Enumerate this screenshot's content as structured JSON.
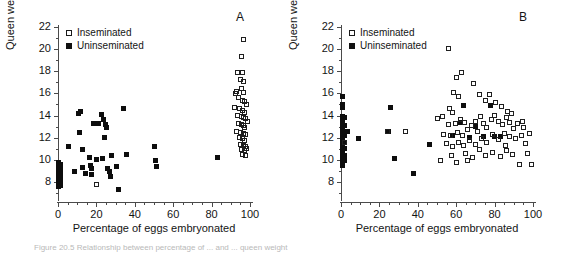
{
  "figure": {
    "caption_partial": "Figure 20.5  Relationship between percentage of ... and ... queen weight"
  },
  "chart_data": [
    {
      "type": "scatter",
      "panel_label": "A",
      "title": "",
      "xlabel": "Percentage of eggs embryonated",
      "ylabel": "Queen weight (mg)",
      "xlim": [
        0,
        100
      ],
      "ylim": [
        7,
        22
      ],
      "xticks": [
        0,
        20,
        40,
        60,
        80,
        100
      ],
      "yticks": [
        8,
        10,
        12,
        14,
        16,
        18,
        20,
        22
      ],
      "xtick_minor_step": 5,
      "ytick_minor_step": 1,
      "grid": false,
      "legend_position": "top-left",
      "legend": [
        "Inseminated",
        "Uninseminated"
      ],
      "series": [
        {
          "name": "Uninseminated",
          "marker": "filled-square",
          "points": [
            [
              0.4,
              9.8
            ],
            [
              0.4,
              9.4
            ],
            [
              0.4,
              9.1
            ],
            [
              0.4,
              8.8
            ],
            [
              0.4,
              8.5
            ],
            [
              0.4,
              8.2
            ],
            [
              0.4,
              7.9
            ],
            [
              0.4,
              7.6
            ],
            [
              1.2,
              9.6
            ],
            [
              1.2,
              9.2
            ],
            [
              1.2,
              8.9
            ],
            [
              1.2,
              8.6
            ],
            [
              1.2,
              8.3
            ],
            [
              1.2,
              8.0
            ],
            [
              1.2,
              7.7
            ],
            [
              5.5,
              11.2
            ],
            [
              8.5,
              8.9
            ],
            [
              10.5,
              14.2
            ],
            [
              11.5,
              14.4
            ],
            [
              11.0,
              12.5
            ],
            [
              12.5,
              10.9
            ],
            [
              13.0,
              9.3
            ],
            [
              14.5,
              8.8
            ],
            [
              16.5,
              10.2
            ],
            [
              17.0,
              9.5
            ],
            [
              17.5,
              9.2
            ],
            [
              17.5,
              8.7
            ],
            [
              18.5,
              13.3
            ],
            [
              19.5,
              13.3
            ],
            [
              21.0,
              13.3
            ],
            [
              20.0,
              10.0
            ],
            [
              22.5,
              14.1
            ],
            [
              23.5,
              13.6
            ],
            [
              24.5,
              13.2
            ],
            [
              25.5,
              12.9
            ],
            [
              24.0,
              12.0
            ],
            [
              23.0,
              10.1
            ],
            [
              26.0,
              9.2
            ],
            [
              27.0,
              8.9
            ],
            [
              27.5,
              8.5
            ],
            [
              28.0,
              10.4
            ],
            [
              30.5,
              9.4
            ],
            [
              31.5,
              7.3
            ],
            [
              34.0,
              14.6
            ],
            [
              35.5,
              10.5
            ],
            [
              50.0,
              11.2
            ],
            [
              51.0,
              9.9
            ],
            [
              51.5,
              9.4
            ],
            [
              83.0,
              10.2
            ]
          ]
        },
        {
          "name": "Inseminated",
          "marker": "open-square",
          "points": [
            [
              20.0,
              7.8
            ],
            [
              96.5,
              20.9
            ],
            [
              95.5,
              19.3
            ],
            [
              93.5,
              17.9
            ],
            [
              96.0,
              17.9
            ],
            [
              95.0,
              17.3
            ],
            [
              96.5,
              17.1
            ],
            [
              93.0,
              16.2
            ],
            [
              95.5,
              16.4
            ],
            [
              96.5,
              16.1
            ],
            [
              94.0,
              15.6
            ],
            [
              96.0,
              15.4
            ],
            [
              97.0,
              15.3
            ],
            [
              92.0,
              14.7
            ],
            [
              94.5,
              14.6
            ],
            [
              96.0,
              14.5
            ],
            [
              97.0,
              14.3
            ],
            [
              93.5,
              14.0
            ],
            [
              95.5,
              13.9
            ],
            [
              96.5,
              13.8
            ],
            [
              97.5,
              13.7
            ],
            [
              94.0,
              13.3
            ],
            [
              95.5,
              13.2
            ],
            [
              96.5,
              13.1
            ],
            [
              97.0,
              12.9
            ],
            [
              93.0,
              12.6
            ],
            [
              95.0,
              12.5
            ],
            [
              96.5,
              12.4
            ],
            [
              97.5,
              12.3
            ],
            [
              94.5,
              12.0
            ],
            [
              96.0,
              11.9
            ],
            [
              97.0,
              11.7
            ],
            [
              95.0,
              11.4
            ],
            [
              96.5,
              11.3
            ],
            [
              97.5,
              11.2
            ],
            [
              95.5,
              10.9
            ],
            [
              97.0,
              10.8
            ],
            [
              96.0,
              10.5
            ],
            [
              97.5,
              10.4
            ],
            [
              98.5,
              13.5
            ],
            [
              98.0,
              15.0
            ],
            [
              92.5,
              16.0
            ],
            [
              98.0,
              11.0
            ]
          ]
        }
      ]
    },
    {
      "type": "scatter",
      "panel_label": "B",
      "title": "",
      "xlabel": "Percentage of eggs embryonated",
      "ylabel": "Queen weight (mg)",
      "xlim": [
        0,
        100
      ],
      "ylim": [
        7,
        22
      ],
      "xticks": [
        0,
        20,
        40,
        60,
        80,
        100
      ],
      "yticks": [
        8,
        10,
        12,
        14,
        16,
        18,
        20,
        22
      ],
      "xtick_minor_step": 5,
      "ytick_minor_step": 1,
      "grid": false,
      "legend_position": "top-left",
      "legend": [
        "Inseminated",
        "Uninseminated"
      ],
      "series": [
        {
          "name": "Uninseminated",
          "marker": "filled-square",
          "points": [
            [
              0.6,
              15.7
            ],
            [
              0.6,
              15.0
            ],
            [
              0.6,
              14.7
            ],
            [
              0.6,
              13.9
            ],
            [
              0.6,
              13.6
            ],
            [
              0.6,
              13.3
            ],
            [
              0.6,
              13.0
            ],
            [
              0.6,
              12.7
            ],
            [
              0.6,
              12.4
            ],
            [
              0.6,
              12.1
            ],
            [
              0.6,
              11.8
            ],
            [
              0.6,
              11.5
            ],
            [
              0.6,
              11.2
            ],
            [
              0.6,
              10.9
            ],
            [
              0.6,
              10.6
            ],
            [
              0.6,
              10.3
            ],
            [
              0.6,
              10.0
            ],
            [
              0.6,
              9.7
            ],
            [
              0.6,
              9.5
            ],
            [
              2.0,
              13.8
            ],
            [
              2.0,
              13.1
            ],
            [
              2.0,
              12.6
            ],
            [
              2.0,
              12.2
            ],
            [
              2.0,
              11.6
            ],
            [
              2.0,
              11.0
            ],
            [
              2.0,
              10.4
            ],
            [
              2.0,
              9.9
            ],
            [
              3.5,
              12.6
            ],
            [
              9.0,
              11.9
            ],
            [
              24.5,
              12.6
            ],
            [
              26.0,
              14.7
            ],
            [
              28.0,
              10.1
            ],
            [
              38.0,
              8.8
            ],
            [
              46.0,
              11.4
            ],
            [
              58.0,
              12.2
            ],
            [
              62.0,
              13.4
            ],
            [
              64.0,
              14.9
            ],
            [
              67.0,
              12.0
            ],
            [
              70.0,
              13.0
            ],
            [
              74.0,
              12.1
            ],
            [
              78.0,
              14.9
            ],
            [
              80.0,
              12.1
            ],
            [
              83.0,
              12.1
            ]
          ]
        },
        {
          "name": "Inseminated",
          "marker": "open-square",
          "points": [
            [
              2.0,
              11.6
            ],
            [
              24.0,
              12.6
            ],
            [
              33.5,
              12.6
            ],
            [
              56.0,
              20.1
            ],
            [
              63.0,
              17.9
            ],
            [
              60.0,
              17.4
            ],
            [
              58.5,
              16.1
            ],
            [
              61.0,
              15.7
            ],
            [
              56.5,
              14.6
            ],
            [
              58.0,
              14.3
            ],
            [
              53.0,
              13.9
            ],
            [
              50.5,
              13.7
            ],
            [
              56.0,
              13.2
            ],
            [
              59.5,
              13.3
            ],
            [
              62.0,
              13.6
            ],
            [
              64.5,
              13.4
            ],
            [
              53.5,
              12.3
            ],
            [
              57.0,
              12.2
            ],
            [
              60.5,
              12.5
            ],
            [
              63.5,
              12.2
            ],
            [
              66.0,
              12.7
            ],
            [
              68.0,
              13.1
            ],
            [
              70.0,
              13.5
            ],
            [
              72.5,
              13.9
            ],
            [
              74.0,
              13.3
            ],
            [
              76.0,
              12.9
            ],
            [
              78.5,
              13.6
            ],
            [
              80.0,
              14.0
            ],
            [
              82.0,
              13.5
            ],
            [
              84.0,
              13.2
            ],
            [
              86.0,
              13.8
            ],
            [
              88.0,
              13.4
            ],
            [
              90.0,
              12.8
            ],
            [
              92.0,
              13.3
            ],
            [
              94.5,
              13.5
            ],
            [
              69.0,
              16.9
            ],
            [
              72.0,
              15.9
            ],
            [
              75.0,
              15.4
            ],
            [
              77.5,
              15.9
            ],
            [
              80.5,
              15.2
            ],
            [
              83.5,
              14.8
            ],
            [
              86.5,
              14.4
            ],
            [
              89.0,
              14.2
            ],
            [
              55.0,
              11.5
            ],
            [
              58.0,
              11.2
            ],
            [
              61.0,
              11.6
            ],
            [
              64.0,
              11.3
            ],
            [
              67.0,
              11.7
            ],
            [
              70.0,
              11.4
            ],
            [
              73.0,
              11.9
            ],
            [
              76.0,
              11.6
            ],
            [
              79.0,
              12.3
            ],
            [
              82.0,
              11.8
            ],
            [
              85.0,
              12.4
            ],
            [
              88.0,
              12.1
            ],
            [
              91.0,
              11.9
            ],
            [
              94.0,
              12.2
            ],
            [
              52.0,
              9.9
            ],
            [
              57.5,
              10.4
            ],
            [
              60.0,
              9.8
            ],
            [
              65.0,
              10.6
            ],
            [
              68.5,
              10.2
            ],
            [
              72.0,
              10.9
            ],
            [
              75.5,
              10.4
            ],
            [
              79.0,
              10.7
            ],
            [
              83.0,
              10.3
            ],
            [
              86.0,
              10.8
            ],
            [
              89.5,
              10.5
            ],
            [
              93.0,
              9.6
            ],
            [
              99.0,
              9.6
            ],
            [
              97.0,
              10.6
            ],
            [
              96.0,
              11.5
            ],
            [
              98.0,
              12.4
            ],
            [
              95.0,
              12.9
            ],
            [
              66.0,
              9.9
            ],
            [
              71.0,
              12.6
            ],
            [
              85.5,
              11.3
            ]
          ]
        }
      ]
    }
  ]
}
